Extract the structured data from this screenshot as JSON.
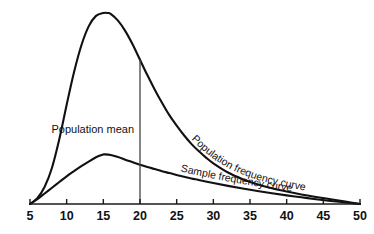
{
  "chart_data": {
    "type": "line",
    "title": "",
    "subtitle": "",
    "xlabel": "",
    "ylabel": "",
    "xlim": [
      5,
      50
    ],
    "ylim": [
      0,
      1
    ],
    "grid": false,
    "legend_position": "inline-curve-labels",
    "xticks": [
      5,
      10,
      15,
      20,
      25,
      30,
      35,
      40,
      45,
      50
    ],
    "xtick_labels": [
      "5",
      "10",
      "15",
      "20",
      "25",
      "30",
      "35",
      "40",
      "45",
      "50"
    ],
    "yticks": [],
    "ytick_labels": [],
    "annotations": [
      {
        "name": "population-mean",
        "text": "Population mean",
        "x": 20,
        "type": "vertical-reference-line"
      }
    ],
    "series": [
      {
        "name": "Population frequency curve",
        "label": "Population frequency curve",
        "peak_x": 15.6,
        "peak_y": 1.0,
        "x": [
          5,
          6,
          7,
          8,
          9,
          10,
          11,
          12,
          13,
          14,
          15,
          15.6,
          16,
          17,
          18,
          19,
          20,
          21,
          22,
          23,
          24,
          25,
          26,
          27,
          28,
          29,
          30,
          32,
          34,
          36,
          38,
          40,
          42,
          44,
          46,
          48,
          50
        ],
        "values": [
          0.0,
          0.03,
          0.09,
          0.19,
          0.34,
          0.52,
          0.69,
          0.83,
          0.93,
          0.985,
          1.0,
          1.0,
          0.995,
          0.96,
          0.905,
          0.835,
          0.755,
          0.675,
          0.6,
          0.53,
          0.465,
          0.41,
          0.36,
          0.315,
          0.277,
          0.243,
          0.213,
          0.165,
          0.13,
          0.103,
          0.082,
          0.065,
          0.05,
          0.037,
          0.025,
          0.013,
          0.0
        ]
      },
      {
        "name": "Sample frequency curve",
        "label": "Sample frequency curve",
        "peak_x": 15.2,
        "peak_y": 0.26,
        "x": [
          5,
          6,
          7,
          8,
          9,
          10,
          11,
          12,
          13,
          14,
          15,
          15.2,
          16,
          17,
          18,
          19,
          20,
          21,
          22,
          23,
          24,
          25,
          26,
          27,
          28,
          30,
          32,
          34,
          36,
          38,
          40,
          42,
          44,
          46,
          48,
          50
        ],
        "values": [
          0.0,
          0.025,
          0.055,
          0.085,
          0.115,
          0.145,
          0.172,
          0.198,
          0.222,
          0.245,
          0.259,
          0.26,
          0.257,
          0.246,
          0.232,
          0.219,
          0.206,
          0.194,
          0.183,
          0.172,
          0.162,
          0.152,
          0.143,
          0.134,
          0.126,
          0.11,
          0.095,
          0.081,
          0.068,
          0.056,
          0.045,
          0.035,
          0.025,
          0.016,
          0.008,
          0.0
        ]
      }
    ],
    "colors": {
      "curve_stroke": "#111111",
      "axis": "#1a1a1a",
      "mean_line": "#444444",
      "text": "#111111",
      "background": "#ffffff"
    }
  }
}
